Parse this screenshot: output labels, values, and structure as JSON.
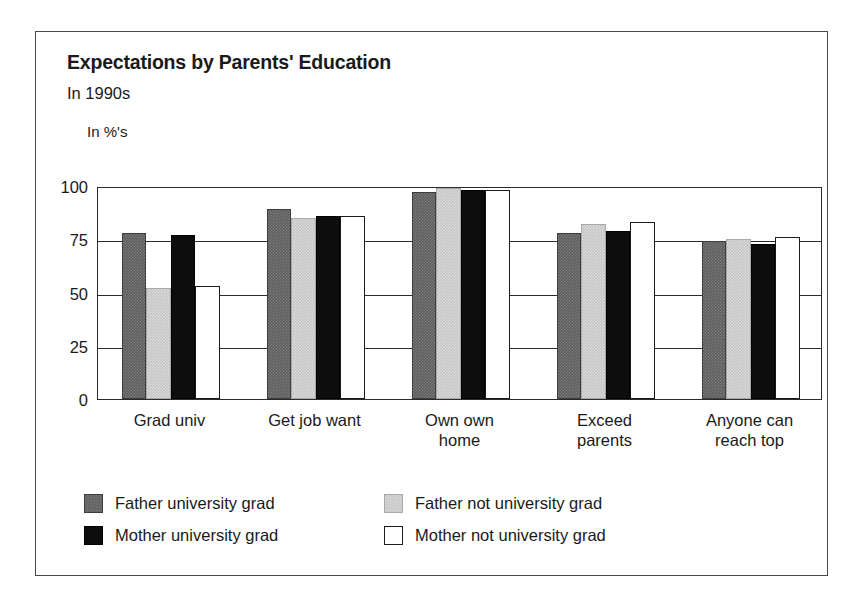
{
  "header": {
    "title": "Expectations by Parents' Education",
    "subtitle": "In 1990s",
    "units": "In %'s"
  },
  "legend": {
    "items": [
      {
        "label": "Father university grad",
        "swatch": "dark-gray-swatch",
        "color": "#5d5d5d"
      },
      {
        "label": "Father not university grad",
        "swatch": "light-gray-swatch",
        "color": "#c3c3c3"
      },
      {
        "label": "Mother university grad",
        "swatch": "black-swatch",
        "color": "#0d0d0d"
      },
      {
        "label": "Mother not university grad",
        "swatch": "white-swatch",
        "color": "#ffffff"
      }
    ]
  },
  "chart_data": {
    "type": "bar",
    "title": "Expectations by Parents' Education",
    "subtitle": "In 1990s",
    "xlabel": "",
    "ylabel": "In %'s",
    "ylim": [
      0,
      100
    ],
    "yticks": [
      0,
      25,
      50,
      75,
      100
    ],
    "ytick_labels": [
      "0",
      "25",
      "50",
      "75",
      "100"
    ],
    "grid": true,
    "legend_position": "below",
    "categories": [
      "Grad univ",
      "Get job want",
      "Own own\nhome",
      "Exceed\nparents",
      "Anyone can\nreach top"
    ],
    "series": [
      {
        "name": "Father university grad",
        "color": "#5d5d5d",
        "values": [
          78,
          89,
          97,
          78,
          74
        ]
      },
      {
        "name": "Father not university grad",
        "color": "#c3c3c3",
        "values": [
          52,
          85,
          99,
          82,
          75
        ]
      },
      {
        "name": "Mother university grad",
        "color": "#0d0d0d",
        "values": [
          77,
          86,
          98,
          79,
          73
        ]
      },
      {
        "name": "Mother not university grad",
        "color": "#ffffff",
        "values": [
          53,
          86,
          98,
          83,
          76
        ]
      }
    ]
  }
}
